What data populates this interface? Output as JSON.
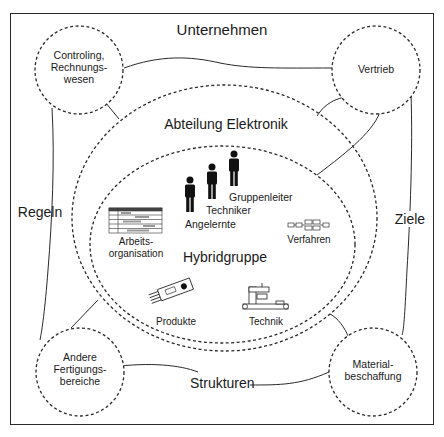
{
  "diagram": {
    "outer_label": "Unternehmen",
    "department_label": "Abteilung Elektronik",
    "group_label": "Hybridgruppe",
    "satellites": {
      "top_left": [
        "Controling,",
        "Rechnungs-",
        "wesen"
      ],
      "top_right": [
        "Vertrieb"
      ],
      "bottom_left": [
        "Andere",
        "Fertigungs-",
        "bereiche"
      ],
      "bottom_right": [
        "Material-",
        "beschaffung"
      ]
    },
    "edge_labels": {
      "left": "Regeln",
      "right": "Ziele",
      "bottom": "Strukturen"
    },
    "roles": {
      "lead": "Gruppenleiter",
      "technician": "Techniker",
      "semi_skilled": "Angelernte"
    },
    "elements": {
      "work_organisation": [
        "Arbeits-",
        "organisation"
      ],
      "procedures": "Verfahren",
      "products": "Produkte",
      "technology": "Technik"
    },
    "icons": {
      "person": "person-silhouette-icon",
      "schedule": "schedule-table-icon",
      "flow": "process-flow-icon",
      "circuit_board": "circuit-board-icon",
      "machine": "machine-tool-icon"
    },
    "colors": {
      "line": "#2a2a2a",
      "text": "#1a1a1a",
      "background": "#ffffff"
    }
  }
}
